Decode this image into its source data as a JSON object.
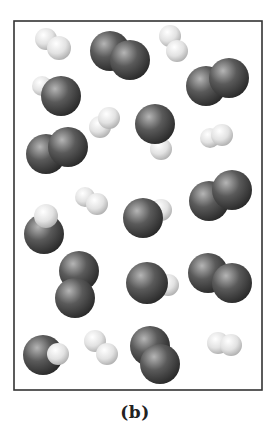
{
  "figure": {
    "caption": "(b)",
    "frame": {
      "x": 14,
      "y": 21,
      "width": 248,
      "height": 369,
      "stroke": "#333333"
    },
    "colors": {
      "dark_atom_highlight": "#b5b5b5",
      "dark_atom_mid": "#5a5a5a",
      "dark_atom_shadow": "#262626",
      "light_atom_highlight": "#ffffff",
      "light_atom_mid": "#e2e2e2",
      "light_atom_shadow": "#a8a8a8"
    },
    "legend_note": "dark spheres = heavy atoms, light spheres = hydrogen atoms",
    "molecules": [
      {
        "id": "m1",
        "type": "H2",
        "atoms": [
          {
            "k": "light",
            "x": 46,
            "y": 39,
            "r": 11
          },
          {
            "k": "light",
            "x": 59,
            "y": 48,
            "r": 12
          }
        ]
      },
      {
        "id": "m2",
        "type": "O2",
        "atoms": [
          {
            "k": "dark",
            "x": 110,
            "y": 51,
            "r": 20
          },
          {
            "k": "dark",
            "x": 130,
            "y": 60,
            "r": 20
          }
        ]
      },
      {
        "id": "m3",
        "type": "H2",
        "atoms": [
          {
            "k": "light",
            "x": 170,
            "y": 36,
            "r": 11
          },
          {
            "k": "light",
            "x": 177,
            "y": 51,
            "r": 11
          }
        ]
      },
      {
        "id": "m4",
        "type": "O2",
        "atoms": [
          {
            "k": "dark",
            "x": 206,
            "y": 86,
            "r": 20
          },
          {
            "k": "dark",
            "x": 229,
            "y": 78,
            "r": 20
          }
        ]
      },
      {
        "id": "m5",
        "type": "OH",
        "atoms": [
          {
            "k": "light",
            "x": 42,
            "y": 86,
            "r": 10
          },
          {
            "k": "dark",
            "x": 61,
            "y": 96,
            "r": 20
          }
        ]
      },
      {
        "id": "m6",
        "type": "H2",
        "atoms": [
          {
            "k": "light",
            "x": 100,
            "y": 127,
            "r": 11
          },
          {
            "k": "light",
            "x": 109,
            "y": 118,
            "r": 11
          }
        ]
      },
      {
        "id": "m7",
        "type": "OH",
        "atoms": [
          {
            "k": "light",
            "x": 161,
            "y": 149,
            "r": 11
          },
          {
            "k": "dark",
            "x": 155,
            "y": 124,
            "r": 20
          }
        ]
      },
      {
        "id": "m8",
        "type": "H2",
        "atoms": [
          {
            "k": "light",
            "x": 210,
            "y": 138,
            "r": 10
          },
          {
            "k": "light",
            "x": 222,
            "y": 135,
            "r": 11
          }
        ]
      },
      {
        "id": "m9",
        "type": "O2",
        "atoms": [
          {
            "k": "dark",
            "x": 46,
            "y": 154,
            "r": 20
          },
          {
            "k": "dark",
            "x": 68,
            "y": 147,
            "r": 20
          }
        ]
      },
      {
        "id": "m10",
        "type": "H2",
        "atoms": [
          {
            "k": "light",
            "x": 85,
            "y": 197,
            "r": 10
          },
          {
            "k": "light",
            "x": 97,
            "y": 204,
            "r": 11
          }
        ]
      },
      {
        "id": "m11",
        "type": "OH",
        "atoms": [
          {
            "k": "dark",
            "x": 44,
            "y": 234,
            "r": 20
          },
          {
            "k": "light",
            "x": 46,
            "y": 216,
            "r": 12
          }
        ]
      },
      {
        "id": "m12",
        "type": "OH",
        "atoms": [
          {
            "k": "light",
            "x": 161,
            "y": 210,
            "r": 11
          },
          {
            "k": "dark",
            "x": 143,
            "y": 218,
            "r": 20
          }
        ]
      },
      {
        "id": "m13",
        "type": "O2",
        "atoms": [
          {
            "k": "dark",
            "x": 209,
            "y": 201,
            "r": 20
          },
          {
            "k": "dark",
            "x": 232,
            "y": 190,
            "r": 20
          }
        ]
      },
      {
        "id": "m14",
        "type": "O2",
        "atoms": [
          {
            "k": "dark",
            "x": 79,
            "y": 271,
            "r": 20
          },
          {
            "k": "dark",
            "x": 75,
            "y": 298,
            "r": 20
          }
        ]
      },
      {
        "id": "m15",
        "type": "OH",
        "atoms": [
          {
            "k": "light",
            "x": 168,
            "y": 285,
            "r": 11
          },
          {
            "k": "dark",
            "x": 147,
            "y": 283,
            "r": 21
          }
        ]
      },
      {
        "id": "m16",
        "type": "O2",
        "atoms": [
          {
            "k": "dark",
            "x": 208,
            "y": 273,
            "r": 20
          },
          {
            "k": "dark",
            "x": 232,
            "y": 283,
            "r": 20
          }
        ]
      },
      {
        "id": "m17",
        "type": "OH",
        "atoms": [
          {
            "k": "dark",
            "x": 43,
            "y": 355,
            "r": 20
          },
          {
            "k": "light",
            "x": 58,
            "y": 354,
            "r": 11
          }
        ]
      },
      {
        "id": "m18",
        "type": "H2",
        "atoms": [
          {
            "k": "light",
            "x": 95,
            "y": 341,
            "r": 11
          },
          {
            "k": "light",
            "x": 107,
            "y": 354,
            "r": 11
          }
        ]
      },
      {
        "id": "m19",
        "type": "O2",
        "atoms": [
          {
            "k": "dark",
            "x": 150,
            "y": 346,
            "r": 20
          },
          {
            "k": "dark",
            "x": 160,
            "y": 364,
            "r": 20
          }
        ]
      },
      {
        "id": "m20",
        "type": "H2",
        "atoms": [
          {
            "k": "light",
            "x": 218,
            "y": 343,
            "r": 11
          },
          {
            "k": "light",
            "x": 231,
            "y": 345,
            "r": 11
          }
        ]
      }
    ]
  }
}
